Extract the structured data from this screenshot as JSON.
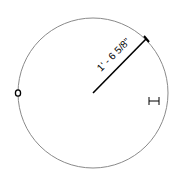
{
  "diagram": {
    "type": "circle-radius-dimension",
    "circle": {
      "cx": 93,
      "cy": 93,
      "r": 75,
      "stroke": "#8a8a8a"
    },
    "radius_dimension": {
      "label": "1' - 6 5/8\"",
      "line_color": "#000000",
      "start": [
        93,
        93
      ],
      "end": [
        146,
        39
      ]
    },
    "left_grip": {
      "label": "circle-grip-icon"
    },
    "right_marker": {
      "label": "i-beam-dimension-icon"
    }
  }
}
